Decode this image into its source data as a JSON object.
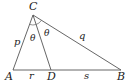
{
  "figure": {
    "stroke_color": "#555555",
    "vertices": {
      "A": {
        "label": "A",
        "x": 13,
        "y": 70
      },
      "B": {
        "label": "B",
        "x": 121,
        "y": 70
      },
      "C": {
        "label": "C",
        "x": 33,
        "y": 15
      },
      "D": {
        "label": "D",
        "x": 51,
        "y": 70
      }
    },
    "sides": {
      "p": {
        "label": "p",
        "between": "A-C"
      },
      "q": {
        "label": "q",
        "between": "C-B"
      },
      "r": {
        "label": "r",
        "between": "A-D"
      },
      "s": {
        "label": "s",
        "between": "D-B"
      }
    },
    "angles": [
      {
        "label": "θ",
        "between": "AC-CD"
      },
      {
        "label": "θ",
        "between": "CD-CB"
      }
    ]
  }
}
